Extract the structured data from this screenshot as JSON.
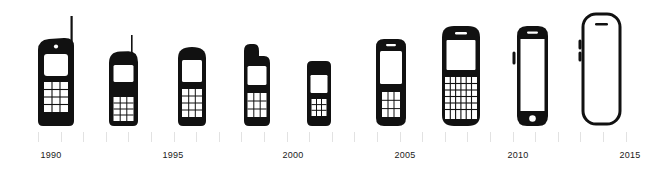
{
  "colors": {
    "background": "#ffffff",
    "phone_body": "#111111",
    "phone_screen": "#ffffff",
    "tick": "#e2e2e2",
    "label_text": "#1a1a1a"
  },
  "axis": {
    "tick_count": 27,
    "tick_start_x": 38,
    "tick_spacing": 22.6,
    "tick_color": "#e2e2e2"
  },
  "year_labels": [
    {
      "text": "1990",
      "x": 51
    },
    {
      "text": "1995",
      "x": 173
    },
    {
      "text": "2000",
      "x": 293
    },
    {
      "text": "2005",
      "x": 405
    },
    {
      "text": "2010",
      "x": 518
    },
    {
      "text": "2015",
      "x": 630
    }
  ],
  "phones": [
    {
      "id": "phone-1990-brick",
      "name": "brick-phone-with-long-antenna",
      "era": "1990",
      "left": 36,
      "width": 44,
      "height": 105,
      "style": "filled",
      "features": [
        "long-antenna",
        "speaker-dot",
        "screen",
        "keypad-4x3"
      ]
    },
    {
      "id": "phone-1993-candybar",
      "name": "candybar-phone-with-short-antenna",
      "era": "1993",
      "left": 107,
      "width": 34,
      "height": 86,
      "style": "filled",
      "features": [
        "short-antenna",
        "screen",
        "keypad-4x3"
      ]
    },
    {
      "id": "phone-1997-candybar",
      "name": "rounded-candybar-phone",
      "era": "1997",
      "left": 176,
      "width": 32,
      "height": 80,
      "style": "filled",
      "features": [
        "rounded-top",
        "screen",
        "keypad-4x3"
      ]
    },
    {
      "id": "phone-2000-stub",
      "name": "phone-with-antenna-stub",
      "era": "2000",
      "left": 240,
      "width": 32,
      "height": 80,
      "style": "filled",
      "features": [
        "antenna-stub",
        "screen",
        "keypad-3x3"
      ]
    },
    {
      "id": "phone-2003-compact",
      "name": "compact-bar-phone",
      "era": "2003",
      "left": 305,
      "width": 28,
      "height": 68,
      "style": "filled",
      "features": [
        "screen",
        "keypad-3x3"
      ]
    },
    {
      "id": "phone-2005-featurephone",
      "name": "feature-phone-with-earpiece",
      "era": "2005",
      "left": 374,
      "width": 34,
      "height": 86,
      "style": "filled",
      "features": [
        "earpiece-slot",
        "large-screen",
        "keypad-3x3"
      ]
    },
    {
      "id": "phone-2009-qwerty",
      "name": "qwerty-smartphone",
      "era": "2009",
      "left": 440,
      "width": 42,
      "height": 98,
      "style": "filled",
      "features": [
        "earpiece-slot",
        "screen",
        "qwerty-keyboard"
      ]
    },
    {
      "id": "phone-2012-touch",
      "name": "touchscreen-phone-with-home-button",
      "era": "2012",
      "left": 511,
      "width": 36,
      "height": 98,
      "style": "filled",
      "features": [
        "earpiece-slot",
        "full-screen",
        "home-button",
        "side-button"
      ]
    },
    {
      "id": "phone-2015-bezelless",
      "name": "modern-bezel-less-phone",
      "era": "2015",
      "left": 576,
      "width": 46,
      "height": 110,
      "style": "outline",
      "features": [
        "earpiece-slot",
        "edge-to-edge-screen",
        "side-buttons",
        "rounded-corners"
      ]
    }
  ]
}
